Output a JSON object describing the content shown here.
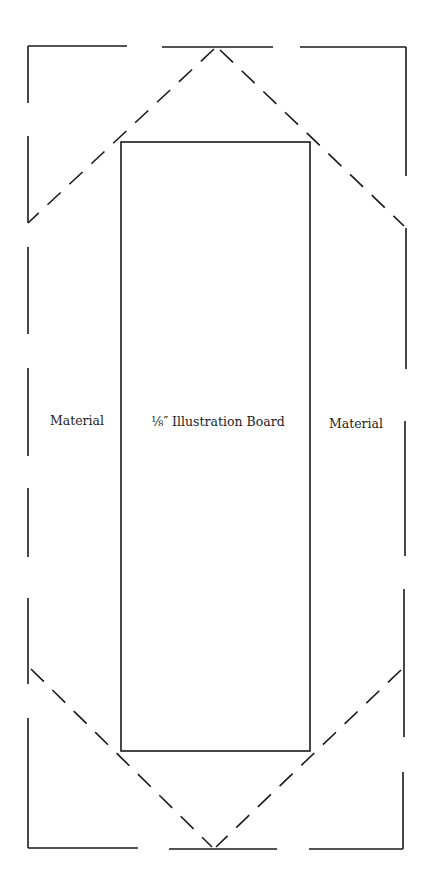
{
  "diagram": {
    "type": "folding pattern",
    "stroke_color": "#1a1a1a",
    "background_color": "#ffffff",
    "labels": {
      "left": "Material",
      "center": "⅛″ Illustration Board",
      "right": "Material"
    }
  }
}
